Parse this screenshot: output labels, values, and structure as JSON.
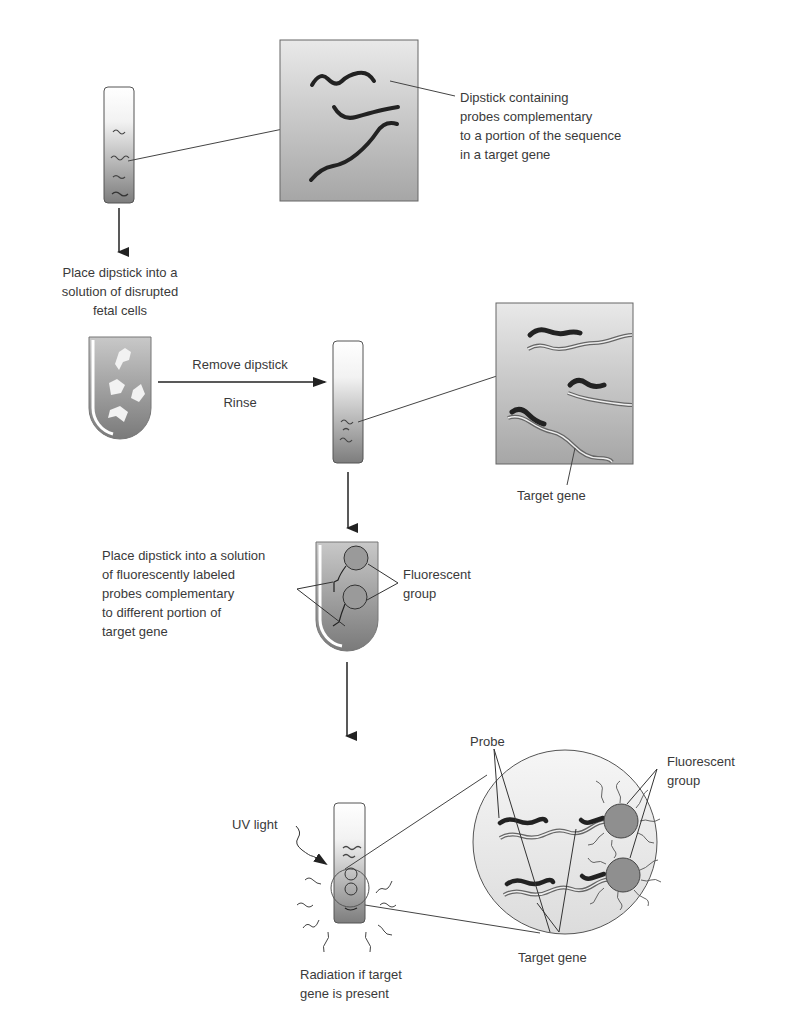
{
  "figure": {
    "steps": [
      {
        "id": "dipstick",
        "label": "Dipstick containing\nprobes complementary\nto a portion of the sequence\nin a target gene"
      },
      {
        "id": "place-into-cells",
        "label": "Place dipstick into a\nsolution of disrupted\nfetal cells"
      },
      {
        "id": "remove",
        "label": "Remove dipstick"
      },
      {
        "id": "rinse",
        "label": "Rinse"
      },
      {
        "id": "target-gene-1",
        "label": "Target gene"
      },
      {
        "id": "place-into-fluor",
        "label": "Place dipstick into a solution\nof fluorescently labeled\nprobes complementary\nto different portion of\ntarget gene"
      },
      {
        "id": "fluor-group-1",
        "label": "Fluorescent\ngroup"
      },
      {
        "id": "uv-light",
        "label": "UV light"
      },
      {
        "id": "radiation",
        "label": "Radiation if target\ngene is present"
      },
      {
        "id": "probe",
        "label": "Probe"
      },
      {
        "id": "fluor-group-2",
        "label": "Fluorescent\ngroup"
      },
      {
        "id": "target-gene-2",
        "label": "Target gene"
      }
    ],
    "caption_partial": "",
    "colors": {
      "ink": "#222222",
      "shade_light": "#e6e6e6",
      "shade_dark": "#8a8a8a",
      "label_text": "#3a3a3a"
    }
  }
}
